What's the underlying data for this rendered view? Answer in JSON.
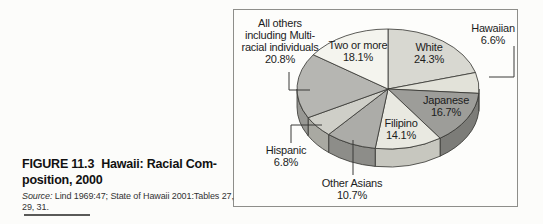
{
  "caption": {
    "figure_label": "FIGURE 11.3",
    "title_line1": "Hawaii: Racial Com-",
    "title_line2": "position, 2000",
    "source_prefix": "Source:",
    "source_rest": " Lind 1969:47; State of Hawaii 2001:Tables 27,",
    "source_line2": "29, 31."
  },
  "chart_data": {
    "type": "pie",
    "style": "3d-pie",
    "legend_position": "labels-around-slices",
    "slices": [
      {
        "label": "White",
        "value": 24.3,
        "color": "#d8d8d1",
        "side_color": "#b3b3ac"
      },
      {
        "label": "Hawaiian",
        "value": 6.6,
        "color": "#e2e2d9",
        "side_color": "#bdbdb4"
      },
      {
        "label": "Japanese",
        "value": 16.7,
        "color": "#9d9d99",
        "side_color": "#7c7c78"
      },
      {
        "label": "Filipino",
        "value": 14.1,
        "color": "#e9e9e1",
        "side_color": "#c7c7bf"
      },
      {
        "label": "Other Asians",
        "value": 10.7,
        "color": "#acaca8",
        "side_color": "#8d8d89"
      },
      {
        "label": "Hispanic",
        "value": 6.8,
        "color": "#cfcfc8",
        "side_color": "#a9a9a2"
      },
      {
        "label": "All others including Multi-racial individuals",
        "value": 20.8,
        "color": "#b6b6b2",
        "side_color": "#989894"
      },
      {
        "label": "Two or more",
        "value": 18.1,
        "color": "#f4f4ee",
        "side_color": "#d2d2cc"
      }
    ],
    "outline_color": "#333330"
  },
  "pie_labels": {
    "all_others": [
      "All others",
      "including Multi-",
      "racial individuals",
      "20.8%"
    ],
    "two_or_more": [
      "Two or more",
      "18.1%"
    ],
    "white": [
      "White",
      "24.3%"
    ],
    "hawaiian": [
      "Hawaiian",
      "6.6%"
    ],
    "japanese": [
      "Japanese",
      "16.7%"
    ],
    "filipino": [
      "Filipino",
      "14.1%"
    ],
    "other_asians": [
      "Other Asians",
      "10.7%"
    ],
    "hispanic": [
      "Hispanic",
      "6.8%"
    ]
  }
}
